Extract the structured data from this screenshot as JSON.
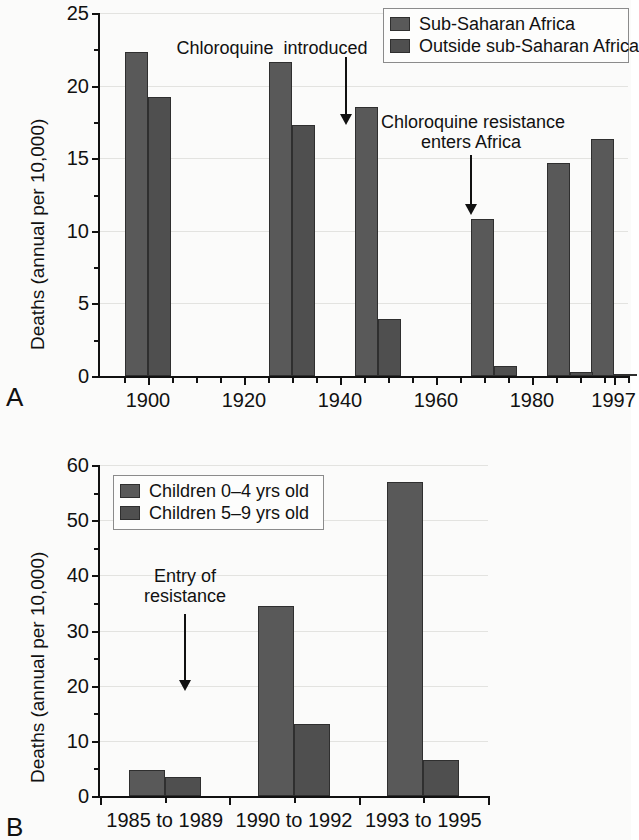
{
  "figure": {
    "background_color": "#fbfbfa",
    "bar_color_series1": "#595959",
    "bar_color_series2": "#4f4f4f",
    "axis_color": "#111111",
    "grid_color": "#e3e3e0"
  },
  "panel_a": {
    "letter": "A",
    "legend": {
      "items": [
        {
          "label": "Sub-Saharan Africa",
          "color": "#595959"
        },
        {
          "label": "Outside sub-Saharan Africa",
          "color": "#4f4f4f"
        }
      ]
    },
    "annotations": [
      {
        "name": "chloroquine-introduced",
        "text": "Chloroquine  introduced"
      },
      {
        "name": "chloroquine-resistance",
        "text": "Chloroquine resistance\nenters Africa"
      }
    ]
  },
  "panel_b": {
    "letter": "B",
    "legend": {
      "items": [
        {
          "label": "Children 0–4 yrs old",
          "color": "#595959"
        },
        {
          "label": "Children 5–9 yrs old",
          "color": "#4f4f4f"
        }
      ]
    },
    "annotations": [
      {
        "name": "entry-of-resistance",
        "text": "Entry of\nresistance"
      }
    ]
  },
  "chart_data": [
    {
      "id": "chart-a",
      "type": "bar",
      "title": "",
      "panel_label": "A",
      "xlabel": "",
      "ylabel": "Deaths (annual per 10,000)",
      "ylim": [
        0,
        25
      ],
      "yticks": [
        0,
        5,
        10,
        15,
        20,
        25
      ],
      "ytick_labels": [
        "0",
        "5",
        "10",
        "15",
        "20",
        "25"
      ],
      "xlim": [
        1890,
        2000
      ],
      "xticks": [
        1900,
        1920,
        1940,
        1960,
        1980,
        1997
      ],
      "xtick_labels": [
        "1900",
        "1920",
        "1940",
        "1960",
        "1980",
        "1997"
      ],
      "grid": true,
      "legend_position": "top-right",
      "series": [
        {
          "name": "Sub-Saharan Africa",
          "color": "#595959",
          "x": [
            1900,
            1930,
            1948,
            1972,
            1988,
            1997
          ],
          "values": [
            22.3,
            21.6,
            18.5,
            10.8,
            14.7,
            16.3
          ]
        },
        {
          "name": "Outside sub-Saharan Africa",
          "color": "#4f4f4f",
          "x": [
            1900,
            1930,
            1948,
            1972,
            1988,
            1997
          ],
          "values": [
            19.2,
            17.3,
            3.9,
            0.7,
            0.3,
            0.1
          ]
        }
      ],
      "annotations": [
        {
          "text": "Chloroquine  introduced",
          "points_to_year": 1946
        },
        {
          "text": "Chloroquine resistance enters Africa",
          "points_to_year": 1978
        }
      ]
    },
    {
      "id": "chart-b",
      "type": "bar",
      "title": "",
      "panel_label": "B",
      "xlabel": "",
      "ylabel": "Deaths (annual per 10,000)",
      "ylim": [
        0,
        60
      ],
      "yticks": [
        0,
        10,
        20,
        30,
        40,
        50,
        60
      ],
      "ytick_labels": [
        "0",
        "10",
        "20",
        "30",
        "40",
        "50",
        "60"
      ],
      "categories": [
        "1985 to 1989",
        "1990 to 1992",
        "1993 to 1995"
      ],
      "grid": true,
      "legend_position": "top-left",
      "series": [
        {
          "name": "Children 0–4 yrs old",
          "color": "#595959",
          "values": [
            4.7,
            34.5,
            57.0
          ]
        },
        {
          "name": "Children 5–9 yrs old",
          "color": "#4f4f4f",
          "values": [
            3.4,
            13.0,
            6.5
          ]
        }
      ],
      "annotations": [
        {
          "text": "Entry of resistance",
          "points_to_category": "1985 to 1989"
        }
      ]
    }
  ]
}
